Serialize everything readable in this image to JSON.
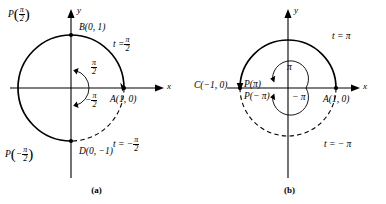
{
  "figure": {
    "panels": [
      {
        "id": "a",
        "caption": "(a)",
        "axes": {
          "x_label": "x",
          "y_label": "y"
        },
        "circle": {
          "center": [
            0,
            0
          ],
          "radius": 1
        },
        "points": [
          {
            "name": "A",
            "label": "A(1, 0)",
            "coords": [
              1,
              0
            ]
          },
          {
            "name": "B",
            "label": "B(0, 1)",
            "coords": [
              0,
              1
            ]
          },
          {
            "name": "D",
            "label": "D(0, −1)",
            "coords": [
              0,
              -1
            ]
          }
        ],
        "param_points": [
          {
            "label_fn": "P",
            "arg_num": "π",
            "arg_den": "2",
            "sign": "",
            "at": [
              0,
              1
            ]
          },
          {
            "label_fn": "P",
            "arg_num": "π",
            "arg_den": "2",
            "sign": "−",
            "at": [
              0,
              -1
            ]
          }
        ],
        "arc_labels": [
          {
            "text": "t =",
            "num": "π",
            "den": "2",
            "sign": "",
            "style": "solid"
          },
          {
            "text": "t = −",
            "num": "π",
            "den": "2",
            "sign": "−",
            "style": "dashed"
          }
        ],
        "inner_angles": [
          {
            "num": "π",
            "den": "2",
            "sign": "",
            "direction": "counterclockwise"
          },
          {
            "num": "π",
            "den": "2",
            "sign": "−",
            "direction": "clockwise"
          }
        ],
        "solid_arc": "from A(1,0) counterclockwise through B(0,1) and C(-1,0) to D(0,-1)",
        "dashed_arc": "from A(1,0) clockwise to D(0,-1)"
      },
      {
        "id": "b",
        "caption": "(b)",
        "axes": {
          "x_label": "x",
          "y_label": "y"
        },
        "circle": {
          "center": [
            0,
            0
          ],
          "radius": 1
        },
        "points": [
          {
            "name": "A",
            "label": "A(1, 0)",
            "coords": [
              1,
              0
            ]
          },
          {
            "name": "C",
            "label": "C(−1, 0)",
            "coords": [
              -1,
              0
            ]
          }
        ],
        "param_points": [
          {
            "label": "P(π)",
            "at": [
              -1,
              0
            ]
          },
          {
            "label": "P(− π)",
            "at": [
              -1,
              0
            ]
          }
        ],
        "arc_labels": [
          {
            "text": "t = π",
            "style": "solid"
          },
          {
            "text": "t = − π",
            "style": "dashed"
          }
        ],
        "inner_angles": [
          {
            "text": "π",
            "direction": "counterclockwise"
          },
          {
            "text": "− π",
            "direction": "clockwise"
          }
        ],
        "solid_arc": "upper semicircle from A(1,0) to C(-1,0)",
        "dashed_arc": "lower semicircle from A(1,0) to C(-1,0)"
      }
    ],
    "colors": {
      "stroke": "#000000",
      "background": "#ffffff",
      "axis": "#000000"
    }
  }
}
